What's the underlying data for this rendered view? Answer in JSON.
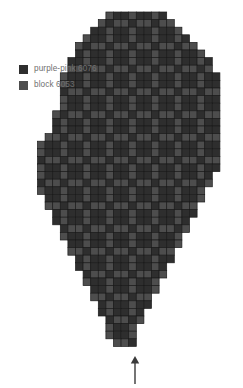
{
  "legend": {
    "items": [
      {
        "label": "purple-pink 6076",
        "color": "#2e2e2e",
        "name": "legend-swatch-purple-pink"
      },
      {
        "label": "block 6053",
        "color": "#4d4d4d",
        "name": "legend-swatch-block"
      }
    ]
  },
  "annotation": {
    "arrow_icon": "arrow-up-icon",
    "arrow_color": "#3a3a3a"
  },
  "chart_data": {
    "type": "heatmap",
    "title": "",
    "xlabel": "",
    "ylabel": "",
    "grid": true,
    "legend_position": "top-left",
    "cell_px": 7.6,
    "origin_x": 37.5,
    "origin_y": 12.0,
    "colors": {
      "dark": "#2e2e2e",
      "light": "#4d4d4d",
      "gridline": "#1b1b1b",
      "background": "#ffffff"
    },
    "categories": [
      "purple-pink 6076",
      "block 6053"
    ],
    "values": [
      2,
      1
    ],
    "cols": 24,
    "rows": 44,
    "rows_extent": [
      [
        9,
        16
      ],
      [
        8,
        17
      ],
      [
        7,
        18
      ],
      [
        6,
        19
      ],
      [
        5,
        20
      ],
      [
        5,
        21
      ],
      [
        4,
        22
      ],
      [
        4,
        22
      ],
      [
        3,
        23
      ],
      [
        3,
        23
      ],
      [
        3,
        23
      ],
      [
        3,
        23
      ],
      [
        3,
        23
      ],
      [
        2,
        23
      ],
      [
        2,
        23
      ],
      [
        2,
        23
      ],
      [
        1,
        23
      ],
      [
        0,
        23
      ],
      [
        0,
        23
      ],
      [
        0,
        23
      ],
      [
        0,
        23
      ],
      [
        0,
        22
      ],
      [
        0,
        22
      ],
      [
        0,
        21
      ],
      [
        1,
        21
      ],
      [
        1,
        20
      ],
      [
        2,
        20
      ],
      [
        2,
        19
      ],
      [
        3,
        19
      ],
      [
        3,
        18
      ],
      [
        4,
        18
      ],
      [
        4,
        17
      ],
      [
        5,
        17
      ],
      [
        5,
        16
      ],
      [
        6,
        16
      ],
      [
        6,
        15
      ],
      [
        7,
        15
      ],
      [
        7,
        14
      ],
      [
        8,
        14
      ],
      [
        8,
        13
      ],
      [
        9,
        13
      ],
      [
        9,
        12
      ],
      [
        9,
        12
      ],
      [
        10,
        12
      ]
    ],
    "motif": {
      "period_x": 6,
      "period_y": 6,
      "light_offsets": [
        [
          0,
          0
        ],
        [
          3,
          0
        ],
        [
          1,
          1
        ],
        [
          2,
          1
        ],
        [
          4,
          1
        ],
        [
          5,
          1
        ],
        [
          0,
          2
        ],
        [
          3,
          2
        ],
        [
          0,
          3
        ],
        [
          3,
          3
        ],
        [
          1,
          4
        ],
        [
          2,
          4
        ],
        [
          4,
          4
        ],
        [
          5,
          4
        ],
        [
          0,
          5
        ],
        [
          3,
          5
        ]
      ]
    },
    "arrow": {
      "x": 135,
      "y_from": 384,
      "y_to": 356,
      "points_to": "bottom-tip-of-chart"
    }
  }
}
